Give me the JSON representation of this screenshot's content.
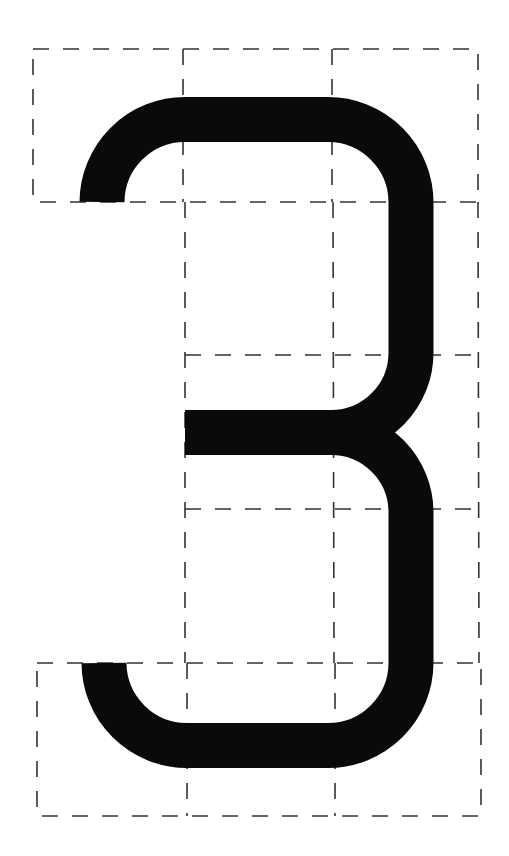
{
  "figure": {
    "glyph": "3",
    "background_color": "#ffffff",
    "glyph_color": "#0a0a0a",
    "grid_color": "#333333",
    "stroke_width": 45,
    "grid": {
      "top_box": {
        "x": 33,
        "y": 49,
        "w": 445,
        "h": 153,
        "dividers_x": [
          183,
          332
        ]
      },
      "middle_box": {
        "x": 185,
        "y": 202,
        "w": 293,
        "h": 461,
        "dividers_x": [
          332
        ],
        "dividers_y": [
          355,
          509
        ]
      },
      "bottom_box": {
        "x": 37,
        "y": 663,
        "w": 444,
        "h": 153,
        "dividers_x": [
          187,
          335
        ]
      }
    }
  }
}
